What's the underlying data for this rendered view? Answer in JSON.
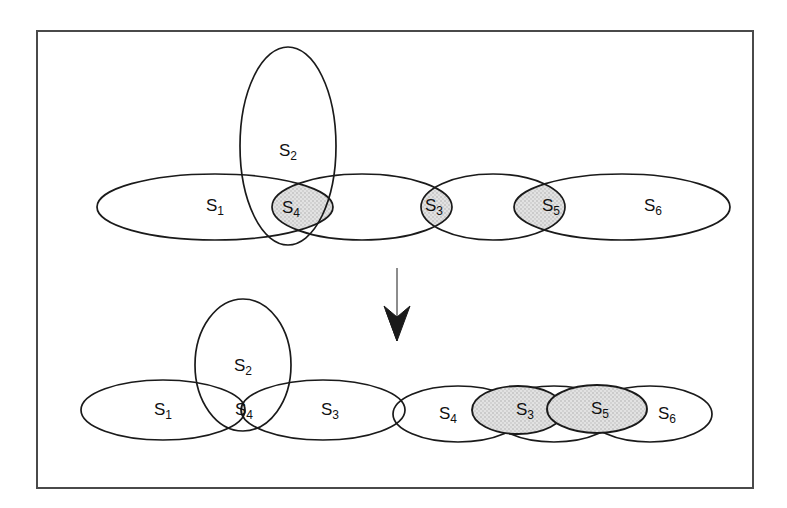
{
  "figure": {
    "frame": {
      "x": 37,
      "y": 31,
      "width": 716,
      "height": 457
    },
    "colors": {
      "stroke": "#1a1a1a",
      "shade": "#dcdcdc",
      "frame": "#4a4a4a",
      "background": "#ffffff"
    },
    "arrow": {
      "name": "down-arrow",
      "direction": "down",
      "x": 397,
      "y_top": 268,
      "y_bottom": 340
    }
  },
  "top_diagram": {
    "name": "before-decomposition",
    "sets": [
      {
        "id": "S1",
        "base": "S",
        "sub": "1",
        "shaded": false,
        "role": "ellipse",
        "cx": 215,
        "cy": 207,
        "rx": 118,
        "ry": 33
      },
      {
        "id": "S2",
        "base": "S",
        "sub": "2",
        "shaded": false,
        "role": "ellipse-vertical",
        "cx": 288,
        "cy": 146,
        "rx": 48,
        "ry": 99
      },
      {
        "id": "S4",
        "base": "S",
        "sub": "4",
        "shaded": true,
        "role": "intersection-lens",
        "cx": 291,
        "cy": 207
      },
      {
        "id": "S3",
        "base": "S",
        "sub": "3",
        "shaded": true,
        "role": "intersection-lens",
        "cx": 434,
        "cy": 207
      },
      {
        "id": "S5",
        "base": "S",
        "sub": "5",
        "shaded": true,
        "role": "intersection-lens",
        "cx": 551,
        "cy": 207
      },
      {
        "id": "S6",
        "base": "S",
        "sub": "6",
        "shaded": false,
        "role": "ellipse",
        "cx": 653,
        "cy": 207,
        "rx": 78,
        "ry": 33
      }
    ],
    "chain": [
      {
        "cx": 215,
        "cy": 207,
        "rx": 118,
        "ry": 33
      },
      {
        "cx": 362,
        "cy": 207,
        "rx": 90,
        "ry": 33
      },
      {
        "cx": 493,
        "cy": 207,
        "rx": 72,
        "ry": 33
      },
      {
        "cx": 622,
        "cy": 207,
        "rx": 108,
        "ry": 33
      }
    ]
  },
  "bottom_left_diagram": {
    "name": "after-decomposition-group-1",
    "sets": [
      {
        "id": "S1",
        "base": "S",
        "sub": "1",
        "shaded": false,
        "role": "ellipse",
        "cx": 163,
        "cy": 410,
        "rx": 82,
        "ry": 30
      },
      {
        "id": "S2",
        "base": "S",
        "sub": "2",
        "shaded": false,
        "role": "ellipse-vertical",
        "cx": 243,
        "cy": 365,
        "rx": 48,
        "ry": 66
      },
      {
        "id": "S4",
        "base": "S",
        "sub": "4",
        "shaded": true,
        "role": "intersection-lens",
        "cx": 244,
        "cy": 410
      },
      {
        "id": "S3",
        "base": "S",
        "sub": "3",
        "shaded": false,
        "role": "ellipse",
        "cx": 323,
        "cy": 410,
        "rx": 82,
        "ry": 30
      }
    ]
  },
  "bottom_right_diagram": {
    "name": "after-decomposition-group-2",
    "sets": [
      {
        "id": "S4",
        "base": "S",
        "sub": "4",
        "shaded": false,
        "role": "ellipse",
        "cx": 458,
        "cy": 414,
        "rx": 65,
        "ry": 28
      },
      {
        "id": "S3",
        "base": "S",
        "sub": "3",
        "shaded": true,
        "role": "ellipse",
        "cx": 518,
        "cy": 410,
        "rx": 46,
        "ry": 24
      },
      {
        "id": "S5",
        "base": "S",
        "sub": "5",
        "shaded": true,
        "role": "ellipse",
        "cx": 597,
        "cy": 409,
        "rx": 50,
        "ry": 24
      },
      {
        "id": "S6",
        "base": "S",
        "sub": "6",
        "shaded": false,
        "role": "ellipse",
        "cx": 650,
        "cy": 414,
        "rx": 62,
        "ry": 28
      }
    ]
  }
}
